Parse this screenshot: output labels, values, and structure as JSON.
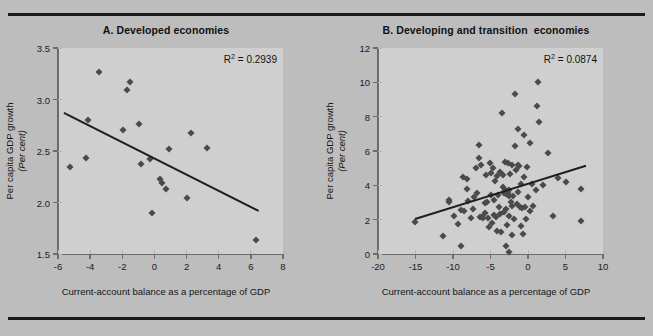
{
  "figure": {
    "background_color": "#bdbdbd",
    "plot_background_color": "#cfcfcf",
    "marker_color": "#4a4a4a",
    "trendline_color": "#1e1e1e",
    "axis_color": "#6b6b6b"
  },
  "chart_data": [
    {
      "type": "scatter",
      "panel": "A",
      "title": "A. Developed economies",
      "xlabel": "Current-account balance as a percentage of GDP",
      "ylabel": "Per capita GDP growth",
      "ylabel_unit": "(Per cent)",
      "annotation": "R² = 0.2939",
      "r_squared": 0.2939,
      "xlim": [
        -6,
        8
      ],
      "ylim": [
        1.5,
        3.5
      ],
      "xticks": [
        -6,
        -4,
        -2,
        0,
        2,
        4,
        6,
        8
      ],
      "xtick_labels": [
        "-6",
        "-4",
        "-2",
        "0",
        "2",
        "4",
        "6",
        "8"
      ],
      "yticks": [
        1.5,
        2.0,
        2.5,
        3.0,
        3.5
      ],
      "ytick_labels": [
        "1.5",
        "2.0",
        "2.5",
        "3.0",
        "3.5"
      ],
      "grid": false,
      "legend": "none",
      "trendline": {
        "x0": -5.6,
        "y0": 2.88,
        "x1": 6.5,
        "y1": 1.93
      },
      "points": [
        {
          "x": -5.25,
          "y": 2.34
        },
        {
          "x": -4.25,
          "y": 2.43
        },
        {
          "x": -4.15,
          "y": 2.8
        },
        {
          "x": -3.45,
          "y": 3.27
        },
        {
          "x": -1.95,
          "y": 2.7
        },
        {
          "x": -1.7,
          "y": 3.09
        },
        {
          "x": -1.55,
          "y": 3.17
        },
        {
          "x": -0.95,
          "y": 2.76
        },
        {
          "x": -0.85,
          "y": 2.37
        },
        {
          "x": -0.3,
          "y": 2.42
        },
        {
          "x": -0.15,
          "y": 1.9
        },
        {
          "x": 0.35,
          "y": 2.23
        },
        {
          "x": 0.5,
          "y": 2.19
        },
        {
          "x": 0.7,
          "y": 2.13
        },
        {
          "x": 0.9,
          "y": 2.52
        },
        {
          "x": 2.05,
          "y": 2.04
        },
        {
          "x": 2.25,
          "y": 2.67
        },
        {
          "x": 3.25,
          "y": 2.53
        },
        {
          "x": 6.35,
          "y": 1.64
        }
      ]
    },
    {
      "type": "scatter",
      "panel": "B",
      "title": "B. Developing and transition  economies",
      "xlabel": "Current-account balance as a percentage of GDP",
      "ylabel": "Per capita GDP growth",
      "ylabel_unit": "(Per cent)",
      "annotation": "R² = 0.0874",
      "r_squared": 0.0874,
      "xlim": [
        -20,
        10
      ],
      "ylim": [
        0,
        12
      ],
      "xticks": [
        -20,
        -15,
        -10,
        -5,
        0,
        5,
        10
      ],
      "xtick_labels": [
        "-20",
        "-15",
        "-10",
        "-5",
        "0",
        "5",
        "10"
      ],
      "yticks": [
        0,
        2,
        4,
        6,
        8,
        10,
        12
      ],
      "ytick_labels": [
        "0",
        "2",
        "4",
        "6",
        "8",
        "10",
        "12"
      ],
      "grid": false,
      "legend": "none",
      "trendline": {
        "x0": -15.1,
        "y0": 2.1,
        "x1": 7.7,
        "y1": 5.2
      },
      "points": [
        {
          "x": -15.1,
          "y": 1.85
        },
        {
          "x": -11.4,
          "y": 1.05
        },
        {
          "x": -10.6,
          "y": 3.05
        },
        {
          "x": -10.5,
          "y": 3.12
        },
        {
          "x": -9.9,
          "y": 2.2
        },
        {
          "x": -9.4,
          "y": 1.72
        },
        {
          "x": -9.0,
          "y": 0.48
        },
        {
          "x": -8.9,
          "y": 2.55
        },
        {
          "x": -8.7,
          "y": 4.48
        },
        {
          "x": -8.6,
          "y": 2.5
        },
        {
          "x": -8.2,
          "y": 3.8
        },
        {
          "x": -8.1,
          "y": 4.35
        },
        {
          "x": -8.0,
          "y": 3.08
        },
        {
          "x": -7.6,
          "y": 2.1
        },
        {
          "x": -7.4,
          "y": 2.62
        },
        {
          "x": -7.2,
          "y": 3.3
        },
        {
          "x": -6.9,
          "y": 5.02
        },
        {
          "x": -6.8,
          "y": 3.58
        },
        {
          "x": -6.6,
          "y": 5.62
        },
        {
          "x": -6.5,
          "y": 6.35
        },
        {
          "x": -6.4,
          "y": 2.15
        },
        {
          "x": -6.3,
          "y": 5.2
        },
        {
          "x": -6.2,
          "y": 2.18
        },
        {
          "x": -6.0,
          "y": 2.12
        },
        {
          "x": -5.8,
          "y": 2.4
        },
        {
          "x": -5.7,
          "y": 2.95
        },
        {
          "x": -5.6,
          "y": 4.58
        },
        {
          "x": -5.5,
          "y": 3.05
        },
        {
          "x": -5.4,
          "y": 2.08
        },
        {
          "x": -5.2,
          "y": 1.6
        },
        {
          "x": -5.1,
          "y": 5.28
        },
        {
          "x": -5.0,
          "y": 4.72
        },
        {
          "x": -4.9,
          "y": 3.42
        },
        {
          "x": -4.8,
          "y": 1.78
        },
        {
          "x": -4.7,
          "y": 5.0
        },
        {
          "x": -4.6,
          "y": 2.25
        },
        {
          "x": -4.5,
          "y": 3.12
        },
        {
          "x": -4.4,
          "y": 4.28
        },
        {
          "x": -4.3,
          "y": 2.18
        },
        {
          "x": -4.2,
          "y": 1.35
        },
        {
          "x": -4.1,
          "y": 4.52
        },
        {
          "x": -4.0,
          "y": 3.45
        },
        {
          "x": -3.9,
          "y": 2.72
        },
        {
          "x": -3.8,
          "y": 4.78
        },
        {
          "x": -3.7,
          "y": 2.32
        },
        {
          "x": -3.6,
          "y": 1.3
        },
        {
          "x": -3.5,
          "y": 8.22
        },
        {
          "x": -3.4,
          "y": 4.62
        },
        {
          "x": -3.3,
          "y": 3.88
        },
        {
          "x": -3.2,
          "y": 3.55
        },
        {
          "x": -3.2,
          "y": 2.45
        },
        {
          "x": -3.1,
          "y": 5.38
        },
        {
          "x": -3.1,
          "y": 3.7
        },
        {
          "x": -3.0,
          "y": 3.62
        },
        {
          "x": -3.0,
          "y": 0.45
        },
        {
          "x": -2.9,
          "y": 3.48
        },
        {
          "x": -2.9,
          "y": 2.6
        },
        {
          "x": -2.8,
          "y": 3.68
        },
        {
          "x": -2.8,
          "y": 1.68
        },
        {
          "x": -2.7,
          "y": 3.55
        },
        {
          "x": -2.7,
          "y": 5.3
        },
        {
          "x": -2.6,
          "y": 3.35
        },
        {
          "x": -2.6,
          "y": 2.22
        },
        {
          "x": -2.5,
          "y": 3.72
        },
        {
          "x": -2.5,
          "y": 0.12
        },
        {
          "x": -2.4,
          "y": 4.65
        },
        {
          "x": -2.3,
          "y": 3.05
        },
        {
          "x": -2.2,
          "y": 2.8
        },
        {
          "x": -2.2,
          "y": 1.12
        },
        {
          "x": -2.1,
          "y": 5.18
        },
        {
          "x": -2.0,
          "y": 3.4
        },
        {
          "x": -1.9,
          "y": 2.05
        },
        {
          "x": -1.8,
          "y": 9.32
        },
        {
          "x": -1.7,
          "y": 6.28
        },
        {
          "x": -1.6,
          "y": 4.92
        },
        {
          "x": -1.5,
          "y": 2.9
        },
        {
          "x": -1.4,
          "y": 7.28
        },
        {
          "x": -1.4,
          "y": 5.18
        },
        {
          "x": -1.3,
          "y": 3.62
        },
        {
          "x": -1.2,
          "y": 5.12
        },
        {
          "x": -1.1,
          "y": 2.72
        },
        {
          "x": -1.0,
          "y": 1.62
        },
        {
          "x": -0.9,
          "y": 4.08
        },
        {
          "x": -0.8,
          "y": 2.68
        },
        {
          "x": -0.7,
          "y": 1.18
        },
        {
          "x": -0.6,
          "y": 6.92
        },
        {
          "x": -0.5,
          "y": 4.48
        },
        {
          "x": -0.4,
          "y": 2.72
        },
        {
          "x": -0.3,
          "y": 2.05
        },
        {
          "x": -0.2,
          "y": 5.08
        },
        {
          "x": 0.0,
          "y": 3.3
        },
        {
          "x": 0.2,
          "y": 6.45
        },
        {
          "x": 0.3,
          "y": 2.5
        },
        {
          "x": 0.5,
          "y": 4.05
        },
        {
          "x": 0.7,
          "y": 2.78
        },
        {
          "x": 1.0,
          "y": 3.72
        },
        {
          "x": 1.2,
          "y": 8.6
        },
        {
          "x": 1.3,
          "y": 10.0
        },
        {
          "x": 1.5,
          "y": 7.7
        },
        {
          "x": 2.0,
          "y": 4.02
        },
        {
          "x": 2.6,
          "y": 5.9
        },
        {
          "x": 3.3,
          "y": 2.2
        },
        {
          "x": 4.0,
          "y": 4.4
        },
        {
          "x": 5.0,
          "y": 4.22
        },
        {
          "x": 7.0,
          "y": 3.78
        },
        {
          "x": 7.0,
          "y": 1.95
        }
      ]
    }
  ]
}
